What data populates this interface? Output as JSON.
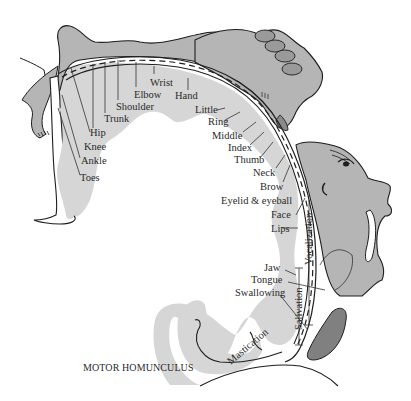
{
  "diagram": {
    "title": "MOTOR HOMUNCULUS",
    "colors": {
      "cortex_fill": "#d4d4d4",
      "body_fill": "#b3b3b3",
      "dark_fill": "#7f7f7f",
      "outline": "#1e1e1e",
      "background": "#ffffff"
    },
    "body_part_labels": [
      {
        "id": "toes",
        "label": "Toes"
      },
      {
        "id": "ankle",
        "label": "Ankle"
      },
      {
        "id": "knee",
        "label": "Knee"
      },
      {
        "id": "hip",
        "label": "Hip"
      },
      {
        "id": "trunk",
        "label": "Trunk"
      },
      {
        "id": "shoulder",
        "label": "Shoulder"
      },
      {
        "id": "elbow",
        "label": "Elbow"
      },
      {
        "id": "wrist",
        "label": "Wrist"
      },
      {
        "id": "hand",
        "label": "Hand"
      },
      {
        "id": "little",
        "label": "Little"
      },
      {
        "id": "ring",
        "label": "Ring"
      },
      {
        "id": "middle",
        "label": "Middle"
      },
      {
        "id": "index",
        "label": "Index"
      },
      {
        "id": "thumb",
        "label": "Thumb"
      },
      {
        "id": "neck",
        "label": "Neck"
      },
      {
        "id": "brow",
        "label": "Brow"
      },
      {
        "id": "eyelid",
        "label": "Eyelid & eyeball"
      },
      {
        "id": "face",
        "label": "Face"
      },
      {
        "id": "lips",
        "label": "Lips"
      },
      {
        "id": "jaw",
        "label": "Jaw"
      },
      {
        "id": "tongue",
        "label": "Tongue"
      },
      {
        "id": "swallowing",
        "label": "Swallowing"
      }
    ],
    "function_labels": [
      {
        "id": "vocalization",
        "label": "Vocalization"
      },
      {
        "id": "salivation",
        "label": "Salivation"
      },
      {
        "id": "mastication",
        "label": "Mastication"
      }
    ]
  }
}
